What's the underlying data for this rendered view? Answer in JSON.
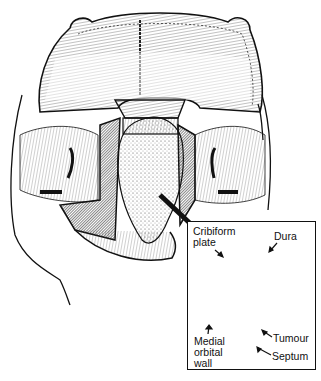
{
  "figure": {
    "colors": {
      "ink": "#111111",
      "paper": "#ffffff"
    }
  },
  "inset": {
    "labels": {
      "cribriform_line1": "Cribiform",
      "cribriform_line2": "plate",
      "dura": "Dura",
      "medial_line1": "Medial",
      "medial_line2": "orbital",
      "medial_line3": "wall",
      "tumour": "Tumour",
      "septum": "Septum"
    }
  }
}
